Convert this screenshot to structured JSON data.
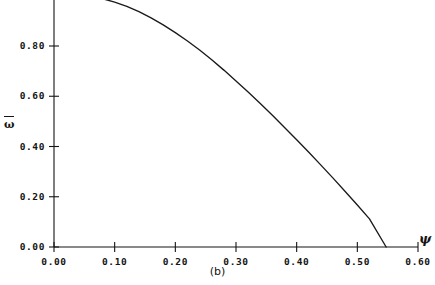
{
  "figure": {
    "caption": "(b)",
    "background_color": "#ffffff",
    "line_color": "#1a1a1a",
    "axis_color": "#141414"
  },
  "chart_data": {
    "type": "line",
    "title": "",
    "subtitle": "",
    "xlabel": "ψ",
    "ylabel": "ω̄",
    "xlim": [
      0.0,
      0.6
    ],
    "ylim": [
      0.0,
      1.0
    ],
    "grid": false,
    "legend": null,
    "xticks": [
      0.0,
      0.1,
      0.2,
      0.3,
      0.4,
      0.5,
      0.6
    ],
    "xtick_labels": [
      "0.00",
      "0.10",
      "0.20",
      "0.30",
      "0.40",
      "0.50",
      "0.60"
    ],
    "yticks": [
      0.0,
      0.2,
      0.4,
      0.6,
      0.8
    ],
    "ytick_labels": [
      "0.00",
      "0.20",
      "0.40",
      "0.60",
      "0.80"
    ],
    "series": [
      {
        "name": "omega-bar",
        "x": [
          0.04,
          0.06,
          0.08,
          0.1,
          0.12,
          0.14,
          0.16,
          0.18,
          0.2,
          0.22,
          0.24,
          0.26,
          0.28,
          0.3,
          0.32,
          0.34,
          0.36,
          0.38,
          0.4,
          0.42,
          0.44,
          0.46,
          0.48,
          0.5,
          0.52,
          0.5475
        ],
        "y": [
          1.0,
          0.996,
          0.988,
          0.975,
          0.958,
          0.937,
          0.912,
          0.884,
          0.853,
          0.82,
          0.784,
          0.745,
          0.704,
          0.661,
          0.617,
          0.571,
          0.524,
          0.476,
          0.427,
          0.377,
          0.326,
          0.274,
          0.221,
          0.167,
          0.112,
          0.0
        ]
      }
    ],
    "annotations": [
      {
        "text": "(b)",
        "role": "panel-label",
        "position": "below-axis-center"
      }
    ],
    "zero_crossing_x": 0.5475
  },
  "axis_labels": {
    "y_symbol": "ω",
    "x_symbol": "ψ"
  }
}
